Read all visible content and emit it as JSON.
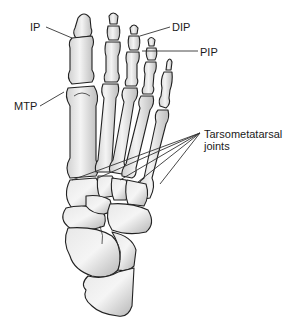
{
  "figure": {
    "labels": {
      "ip": "IP",
      "mtp": "MTP",
      "dip": "DIP",
      "pip": "PIP",
      "tarsometatarsal_line1": "Tarsometatarsal",
      "tarsometatarsal_line2": "joints"
    },
    "colors": {
      "background": "#ffffff",
      "bone_light": "#f2f2f2",
      "bone_dark": "#b8b8b8",
      "outline": "#222222",
      "text": "#1a1a1a"
    }
  }
}
